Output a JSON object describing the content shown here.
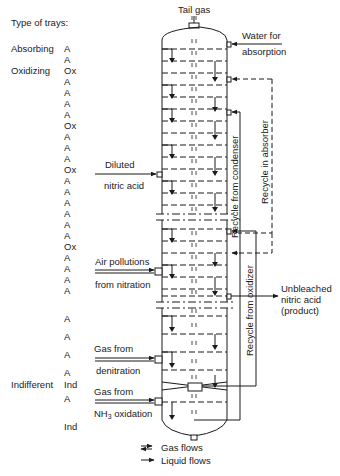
{
  "title": "Type of trays:",
  "categories": [
    {
      "label": "Absorbing",
      "y": 43
    },
    {
      "label": "Oxidizing",
      "y": 65
    },
    {
      "label": "Indifferent",
      "y": 379
    }
  ],
  "trays": [
    {
      "label": "A",
      "y": 43
    },
    {
      "label": "A",
      "y": 54
    },
    {
      "label": "Ox",
      "y": 65
    },
    {
      "label": "A",
      "y": 76
    },
    {
      "label": "A",
      "y": 87
    },
    {
      "label": "A",
      "y": 98
    },
    {
      "label": "A",
      "y": 109
    },
    {
      "label": "Ox",
      "y": 120
    },
    {
      "label": "A",
      "y": 131
    },
    {
      "label": "A",
      "y": 142
    },
    {
      "label": "A",
      "y": 153
    },
    {
      "label": "Ox",
      "y": 164
    },
    {
      "label": "A",
      "y": 175
    },
    {
      "label": "A",
      "y": 186
    },
    {
      "label": "A",
      "y": 197
    },
    {
      "label": "A",
      "y": 208
    },
    {
      "label": "A",
      "y": 219
    },
    {
      "label": "A",
      "y": 230
    },
    {
      "label": "Ox",
      "y": 241
    },
    {
      "label": "A",
      "y": 252
    },
    {
      "label": "A",
      "y": 263
    },
    {
      "label": "A",
      "y": 274
    },
    {
      "label": "A",
      "y": 285
    },
    {
      "label": "A",
      "y": 313
    },
    {
      "label": "A",
      "y": 331
    },
    {
      "label": "A",
      "y": 349
    },
    {
      "label": "A",
      "y": 367
    },
    {
      "label": "Ind",
      "y": 379
    },
    {
      "label": "A",
      "y": 393
    },
    {
      "label": "Ind",
      "y": 421
    }
  ],
  "inputs_left": {
    "diluted_1": "Diluted",
    "diluted_2": "nitric acid",
    "air_1": "Air pollutions",
    "air_2": "from nitration",
    "denit_1": "Gas from",
    "denit_2": "denitration",
    "nh3_1": "Gas from",
    "nh3_2_main": "NH",
    "nh3_2_sub": "3",
    "nh3_2_rest": " oxidation"
  },
  "top": {
    "tail_gas": "Tail gas",
    "water_1": "Water for",
    "water_2": "absorption"
  },
  "recycles": {
    "condenser": "Recycle from condenser",
    "absorber": "Recycle  in  absorber",
    "oxidizer": "Recycle from  oxidizer"
  },
  "product": {
    "line_1": "Unbleached",
    "line_2": "nitric acid",
    "line_3": "(product)"
  },
  "legend": {
    "gas": "Gas flows",
    "liquid": "Liquid flows"
  },
  "colors": {
    "ink": "#1a1a1a",
    "background": "#ffffff"
  }
}
